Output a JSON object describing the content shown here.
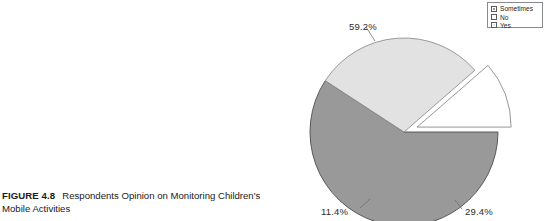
{
  "figure": {
    "number_label": "FIGURE 4.8",
    "caption_text": "Respondents Opinion on Monitoring Children's Mobile Activities"
  },
  "legend": {
    "position": "top-right",
    "entries": [
      {
        "label": "Sometimes",
        "color": "#999999",
        "marker": "legend-swatch-sometimes"
      },
      {
        "label": "No",
        "color": "#ffffff",
        "marker": "legend-swatch-no"
      },
      {
        "label": "Yes",
        "color": "#e2e2e2",
        "marker": "legend-swatch-yes"
      }
    ]
  },
  "chart_data": {
    "type": "pie",
    "title": "",
    "subtitle": "",
    "xlabel": "",
    "ylabel": "",
    "grid": false,
    "legend_position": "top-right",
    "categories": [
      "Sometimes",
      "Yes",
      "No"
    ],
    "values": [
      59.2,
      29.4,
      11.4
    ],
    "labels": [
      "59.2%",
      "29.4%",
      "11.4%"
    ],
    "colors": [
      "#999999",
      "#e2e2e2",
      "#ffffff"
    ],
    "exploded": [
      "No"
    ],
    "start_angle_deg": 0,
    "direction": "clockwise",
    "units": "percent"
  },
  "pie_geometry": {
    "center_x": 114,
    "center_y": 132,
    "radius": 94
  }
}
